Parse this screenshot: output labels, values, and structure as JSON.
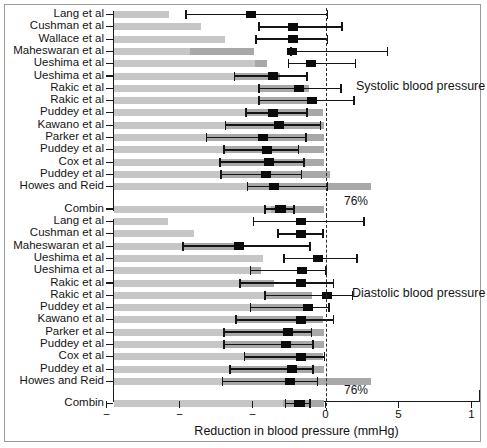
{
  "figure": {
    "xlabel": "Reduction in blood pressure (mmHg)",
    "panel_titles": {
      "systolic": "Systolic blood pressure",
      "diastolic": "Diastolic blood pressure"
    },
    "summary_percent_systolic": "76%",
    "summary_percent_diastolic": "76%",
    "colors": {
      "bar": "#c6c6c6",
      "marker": "#0b0b0b",
      "axis": "#1a1a1a",
      "zero_line": "#2a2a2a",
      "text": "#141414"
    }
  },
  "chart_data": {
    "type": "bar",
    "title": "",
    "subtitle": "",
    "xlabel": "Reduction in blood pressure (mmHg)",
    "ylabel": "",
    "xlim": [
      -15,
      10
    ],
    "xticks": [
      -15,
      -10,
      -5,
      0,
      5,
      10
    ],
    "xticklabels": [
      "−",
      "−",
      "−",
      "0",
      "5",
      "1"
    ],
    "grid": false,
    "legend": null,
    "zero_reference": 0,
    "panels": [
      {
        "name": "systolic",
        "title": "Systolic blood pressure",
        "summary_percent": "76%",
        "rows": [
          {
            "label": "Lang et al",
            "bar_end": -10.7,
            "bar_end2": -9.7,
            "est": -5.1,
            "ci_low": -9.6,
            "ci_high": 0.2
          },
          {
            "label": "Cushman et al",
            "bar_end": -8.5,
            "bar_end2": null,
            "est": -2.2,
            "ci_low": -4.6,
            "ci_high": 1.2
          },
          {
            "label": "Wallace et al",
            "bar_end": -6.9,
            "bar_end2": null,
            "est": -2.2,
            "ci_low": -4.8,
            "ci_high": 0.2
          },
          {
            "label": "Maheswaran et al",
            "bar_end": -4.9,
            "bar_end2": -9.3,
            "est": -2.3,
            "ci_low": -2.4,
            "ci_high": 4.3
          },
          {
            "label": "Ueshima et al",
            "bar_end": -4.0,
            "bar_end2": -4.8,
            "est": -1.0,
            "ci_low": -2.6,
            "ci_high": 2.1
          },
          {
            "label": "Ueshima et al",
            "bar_end": -3.1,
            "bar_end2": -6.2,
            "est": -3.6,
            "ci_low": -6.3,
            "ci_high": -1.2
          },
          {
            "label": "Rakic et al",
            "bar_end": -1.1,
            "bar_end2": -4.6,
            "est": -1.8,
            "ci_low": -4.6,
            "ci_high": 1.1
          },
          {
            "label": "Rakic et al",
            "bar_end": -1.1,
            "bar_end2": -4.6,
            "est": -0.9,
            "ci_low": -4.6,
            "ci_high": 2.0
          },
          {
            "label": "Puddey et al",
            "bar_end": -0.2,
            "bar_end2": -5.5,
            "est": -3.6,
            "ci_low": -5.5,
            "ci_high": -1.2
          },
          {
            "label": "Kawano et al",
            "bar_end": -0.1,
            "bar_end2": -6.9,
            "est": -3.2,
            "ci_low": -6.9,
            "ci_high": -0.3
          },
          {
            "label": "Parker et al",
            "bar_end": -0.1,
            "bar_end2": -8.2,
            "est": -4.3,
            "ci_low": -8.2,
            "ci_high": -1.3
          },
          {
            "label": "Puddey et al",
            "bar_end": -0.1,
            "bar_end2": -7.0,
            "est": -4.0,
            "ci_low": -7.0,
            "ci_high": -1.8
          },
          {
            "label": "Cox et al",
            "bar_end": -0.1,
            "bar_end2": -7.3,
            "est": -3.9,
            "ci_low": -7.3,
            "ci_high": -1.4
          },
          {
            "label": "Puddey et al",
            "bar_end": 0.3,
            "bar_end2": -7.2,
            "est": -4.1,
            "ci_low": -7.2,
            "ci_high": -1.6
          },
          {
            "label": "Howes and Reid",
            "bar_end": 3.1,
            "bar_end2": -5.4,
            "est": -3.5,
            "ci_low": -5.4,
            "ci_high": 0.2
          },
          {
            "label": "Combin",
            "bar_end": -0.1,
            "bar_end2": -3.7,
            "est": -3.1,
            "ci_low": -4.2,
            "ci_high": -2.1,
            "summary": true
          }
        ]
      },
      {
        "name": "diastolic",
        "title": "Diastolic blood pressure",
        "summary_percent": "76%",
        "rows": [
          {
            "label": "Lang et al",
            "bar_end": -10.8,
            "bar_end2": null,
            "est": -1.7,
            "ci_low": -5.0,
            "ci_high": 2.7
          },
          {
            "label": "Cushman et al",
            "bar_end": -9.0,
            "bar_end2": null,
            "est": -1.7,
            "ci_low": -3.3,
            "ci_high": -0.1
          },
          {
            "label": "Maheswaran et al",
            "bar_end": -6.0,
            "bar_end2": -9.8,
            "est": -5.9,
            "ci_low": -9.8,
            "ci_high": -1.0
          },
          {
            "label": "Ueshima et al",
            "bar_end": -4.3,
            "bar_end2": null,
            "est": -0.5,
            "ci_low": -2.9,
            "ci_high": 2.2
          },
          {
            "label": "Ueshima et al",
            "bar_end": -4.4,
            "bar_end2": -5.2,
            "est": -1.6,
            "ci_low": -5.2,
            "ci_high": 0.1
          },
          {
            "label": "Rakic et al",
            "bar_end": -3.5,
            "bar_end2": -5.9,
            "est": -1.7,
            "ci_low": -5.9,
            "ci_high": 0.6
          },
          {
            "label": "Rakic et al",
            "bar_end": -0.9,
            "bar_end2": -4.2,
            "est": 0.1,
            "ci_low": -4.2,
            "ci_high": 1.9
          },
          {
            "label": "Puddey et al",
            "bar_end": -1.2,
            "bar_end2": -5.2,
            "est": -1.2,
            "ci_low": -5.2,
            "ci_high": 0.3
          },
          {
            "label": "Kawano et al",
            "bar_end": -0.2,
            "bar_end2": -6.2,
            "est": -1.7,
            "ci_low": -6.2,
            "ci_high": 0.6
          },
          {
            "label": "Parker et al",
            "bar_end": -0.1,
            "bar_end2": -7.0,
            "est": -2.6,
            "ci_low": -7.0,
            "ci_high": -0.9
          },
          {
            "label": "Puddey et al",
            "bar_end": -0.1,
            "bar_end2": -7.0,
            "est": -2.7,
            "ci_low": -7.0,
            "ci_high": -0.8
          },
          {
            "label": "Cox et al",
            "bar_end": -0.2,
            "bar_end2": -5.6,
            "est": -1.7,
            "ci_low": -5.6,
            "ci_high": 0.0
          },
          {
            "label": "Puddey et al",
            "bar_end": -0.1,
            "bar_end2": -6.6,
            "est": -2.3,
            "ci_low": -6.6,
            "ci_high": -0.8
          },
          {
            "label": "Howes and Reid",
            "bar_end": 3.1,
            "bar_end2": -7.1,
            "est": -2.4,
            "ci_low": -7.1,
            "ci_high": -0.5
          },
          {
            "label": "Combin",
            "bar_end": -0.1,
            "bar_end2": -2.9,
            "est": -1.8,
            "ci_low": -2.8,
            "ci_high": -1.0,
            "summary": true
          }
        ]
      }
    ]
  }
}
